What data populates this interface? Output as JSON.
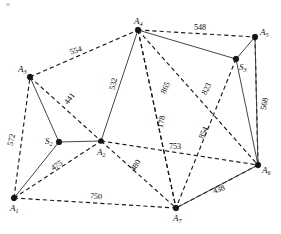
{
  "figure": {
    "kind": "undirected-weighted-graph-diagram",
    "width": 281,
    "height": 234,
    "background": "#ffffff",
    "ink_color": "#141414"
  },
  "chart_data": {
    "type": "diagram",
    "title": "",
    "nodes": [
      {
        "id": "A1",
        "label": "A",
        "sub": "1",
        "x": 14,
        "y": 198,
        "label_dx": -4,
        "label_dy": 6,
        "style": "filled"
      },
      {
        "id": "A2",
        "label": "A",
        "sub": "2",
        "x": 101,
        "y": 141,
        "label_dx": -4,
        "label_dy": 7,
        "style": "filled-star"
      },
      {
        "id": "A3",
        "label": "A",
        "sub": "3",
        "x": 30,
        "y": 77,
        "label_dx": -12,
        "label_dy": -12,
        "style": "filled"
      },
      {
        "id": "A4",
        "label": "A",
        "sub": "4",
        "x": 138,
        "y": 30,
        "label_dx": -4,
        "label_dy": -13,
        "style": "filled"
      },
      {
        "id": "A5",
        "label": "A",
        "sub": "5",
        "x": 255,
        "y": 37,
        "label_dx": 5,
        "label_dy": -9,
        "style": "filled"
      },
      {
        "id": "A6",
        "label": "A",
        "sub": "6",
        "x": 258,
        "y": 165,
        "label_dx": 4,
        "label_dy": 1,
        "style": "filled"
      },
      {
        "id": "A7",
        "label": "A",
        "sub": "7",
        "x": 176,
        "y": 208,
        "label_dx": -3,
        "label_dy": 6,
        "style": "filled"
      },
      {
        "id": "S2",
        "label": "S",
        "sub": "2",
        "x": 59,
        "y": 142,
        "label_dx": -14,
        "label_dy": -5,
        "style": "filled"
      },
      {
        "id": "S3",
        "label": "S",
        "sub": "3",
        "x": 236,
        "y": 59,
        "label_dx": 3,
        "label_dy": 4,
        "style": "filled"
      }
    ],
    "edges": [
      {
        "from": "A3",
        "to": "A4",
        "style": "dashed",
        "weight": "554"
      },
      {
        "from": "A4",
        "to": "A5",
        "style": "dashed",
        "weight": "548"
      },
      {
        "from": "A1",
        "to": "A3",
        "style": "dashed",
        "weight": "572"
      },
      {
        "from": "A5",
        "to": "A6",
        "style": "dashed",
        "weight": "568"
      },
      {
        "from": "A1",
        "to": "A7",
        "style": "dashed",
        "weight": "750"
      },
      {
        "from": "A3",
        "to": "A2",
        "style": "dashed",
        "weight": "441"
      },
      {
        "from": "A4",
        "to": "A2",
        "style": "solid",
        "weight": "532"
      },
      {
        "from": "A4",
        "to": "A7",
        "style": "dashed",
        "weight": "865"
      },
      {
        "from": "A4",
        "to": "A6",
        "style": "dashed",
        "weight": "823"
      },
      {
        "from": "A4",
        "to": "S3",
        "style": "solid",
        "weight": ""
      },
      {
        "from": "A2",
        "to": "A6",
        "style": "dashed",
        "weight": "753"
      },
      {
        "from": "A2",
        "to": "A7",
        "style": "dashed",
        "weight": "480"
      },
      {
        "from": "A2",
        "to": "S2",
        "style": "solid",
        "weight": ""
      },
      {
        "from": "A1",
        "to": "A2",
        "style": "dashed",
        "weight": "475"
      },
      {
        "from": "A1",
        "to": "S2",
        "style": "solid",
        "weight": ""
      },
      {
        "from": "A3",
        "to": "S2",
        "style": "solid",
        "weight": ""
      },
      {
        "from": "A6",
        "to": "A7",
        "style": "solid",
        "weight": "438"
      },
      {
        "from": "S3",
        "to": "A7",
        "style": "dashed",
        "weight": "854"
      },
      {
        "from": "S3",
        "to": "A5",
        "style": "solid",
        "weight": ""
      },
      {
        "from": "S3",
        "to": "A6",
        "style": "solid",
        "weight": ""
      },
      {
        "from": "A5",
        "to": "A6",
        "style": "solid",
        "weight": ""
      },
      {
        "from": "A6",
        "to": "A7",
        "style": "dashed",
        "weight": ""
      },
      {
        "from": "A4",
        "to": "A7",
        "style": "dashed-short",
        "weight": "178"
      }
    ],
    "edge_labels": [
      {
        "text": "554",
        "x": 76,
        "y": 51,
        "rotate": -16
      },
      {
        "text": "548",
        "x": 200,
        "y": 28,
        "rotate": 0
      },
      {
        "text": "572",
        "x": 12,
        "y": 140,
        "rotate": -78
      },
      {
        "text": "568",
        "x": 265,
        "y": 104,
        "rotate": -80
      },
      {
        "text": "750",
        "x": 96,
        "y": 197,
        "rotate": 4
      },
      {
        "text": "441",
        "x": 70,
        "y": 99,
        "rotate": -52
      },
      {
        "text": "532",
        "x": 114,
        "y": 84,
        "rotate": -78
      },
      {
        "text": "865",
        "x": 166,
        "y": 88,
        "rotate": -66
      },
      {
        "text": "823",
        "x": 207,
        "y": 89,
        "rotate": -62
      },
      {
        "text": "753",
        "x": 175,
        "y": 147,
        "rotate": 0
      },
      {
        "text": "480",
        "x": 136,
        "y": 166,
        "rotate": -57
      },
      {
        "text": "475",
        "x": 57,
        "y": 166,
        "rotate": -32
      },
      {
        "text": "438",
        "x": 219,
        "y": 190,
        "rotate": -20
      },
      {
        "text": "854",
        "x": 204,
        "y": 133,
        "rotate": -66
      },
      {
        "text": "178",
        "x": 162,
        "y": 122,
        "rotate": -80
      }
    ],
    "legend": [],
    "xlabel": "",
    "ylabel": ""
  }
}
